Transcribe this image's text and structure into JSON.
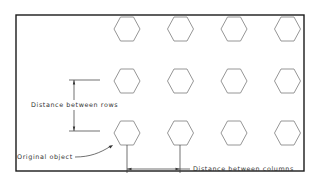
{
  "diagram": {
    "type": "rectangular-array-illustration",
    "grid": {
      "rows": 3,
      "columns": 4
    },
    "object_shape": "hexagon",
    "labels": {
      "rows_distance": "Distance between rows",
      "columns_distance": "Distance between columns",
      "original_object": "Original object"
    },
    "colors": {
      "frame": "#1a1a1a",
      "hexagon": "#8a8a8a",
      "dimension": "#333333",
      "background": "#ffffff"
    }
  }
}
